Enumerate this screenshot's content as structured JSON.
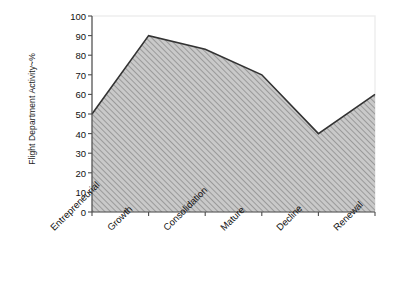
{
  "chart_data": {
    "type": "area",
    "title": "",
    "xlabel": "",
    "ylabel": "Flight Department Activity~%",
    "categories": [
      "Entrepreneurial",
      "Growth",
      "Consolidation",
      "Mature",
      "Decline",
      "Renewal"
    ],
    "values": [
      50,
      90,
      83,
      70,
      40,
      60
    ],
    "ylim": [
      0,
      100
    ],
    "ytick_values": [
      0,
      10,
      20,
      30,
      40,
      50,
      60,
      70,
      80,
      90,
      100
    ],
    "ytick_labels": [
      "0",
      "10",
      "20",
      "30",
      "40",
      "50",
      "60",
      "70",
      "80",
      "90",
      "100"
    ],
    "grid": false,
    "legend": null,
    "series": [
      {
        "name": "Flight Department Activity",
        "values": [
          50,
          90,
          83,
          70,
          40,
          60
        ]
      }
    ],
    "style": {
      "fill": "#bdbdbd",
      "hatch": "diagonal-lines",
      "hatch_color": "#8a8a8a",
      "line_color": "#333333",
      "axis_color": "#4d4d4d",
      "plot_border_color": "#e0e0e0",
      "background": "#ffffff",
      "xlabel_rotation_deg": -45
    }
  }
}
